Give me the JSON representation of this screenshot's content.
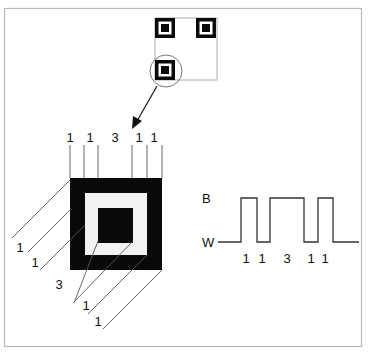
{
  "diagram": {
    "finder_pattern_overview": {
      "description": "QR code outline with three finder patterns; bottom-left one circled"
    },
    "module_ratio_top": [
      "1",
      "1",
      "3",
      "1",
      "1"
    ],
    "module_ratio_diagonal": [
      "1",
      "1",
      "3",
      "1",
      "1"
    ],
    "signal": {
      "high_label": "B",
      "low_label": "W",
      "ratio_labels": [
        "1",
        "1",
        "3",
        "1",
        "1"
      ]
    },
    "colors": {
      "frame": "#b8b8b8",
      "black": "#0a0a0a",
      "light_fill": "#f2f2f2",
      "line": "#444444"
    }
  }
}
